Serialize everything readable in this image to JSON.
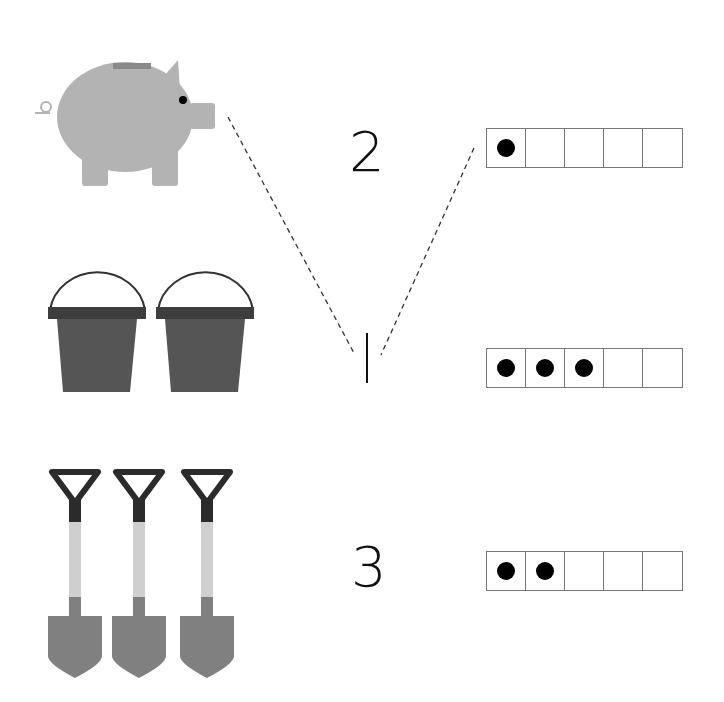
{
  "worksheet": {
    "rows": [
      {
        "picture": "piggy-bank",
        "picture_count": 1,
        "numeral": "2",
        "ten_frame_dots": 1
      },
      {
        "picture": "bucket",
        "picture_count": 2,
        "numeral": "1",
        "ten_frame_dots": 3
      },
      {
        "picture": "shovel",
        "picture_count": 3,
        "numeral": "3",
        "ten_frame_dots": 2
      }
    ],
    "connections": [
      {
        "from": "piggy-bank",
        "to": "numeral-1",
        "style": "dashed"
      },
      {
        "from": "numeral-1",
        "to": "frame-row-1",
        "style": "dashed"
      }
    ],
    "colors": {
      "pig": "#b3b3b3",
      "bucket": "#555555",
      "bucket_rim": "#3d3d3d",
      "shovel_handle": "#2b2b2b",
      "shovel_shaft": "#cfcfcf",
      "shovel_blade": "#808080",
      "dot": "#000000"
    }
  },
  "numerals": {
    "n1": "2",
    "n2": "1",
    "n3": "3"
  }
}
